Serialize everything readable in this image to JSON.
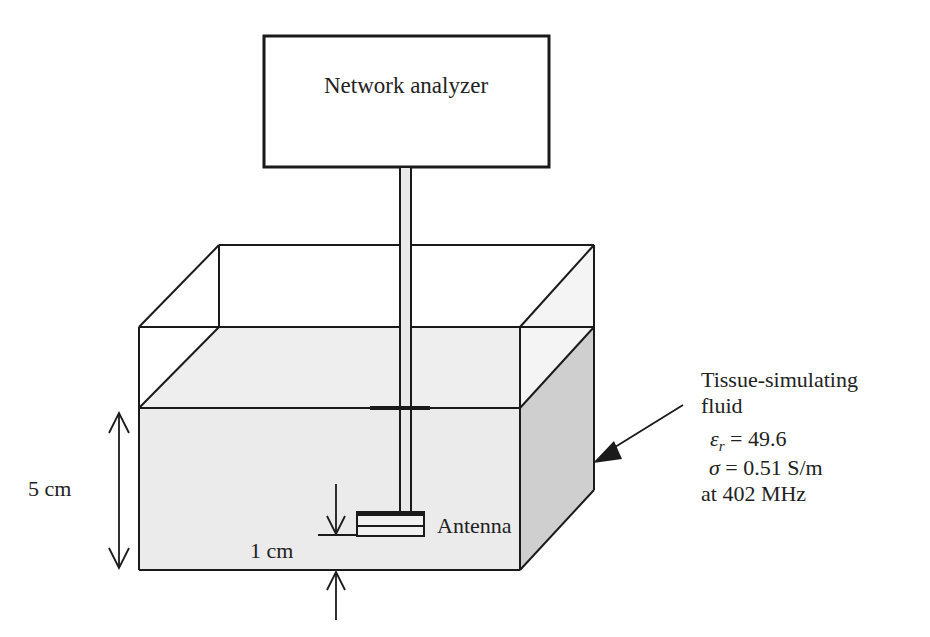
{
  "diagram": {
    "analyzer": {
      "label": "Network analyzer"
    },
    "antenna": {
      "label": "Antenna"
    },
    "fluid": {
      "title_line1": "Tissue-simulating",
      "title_line2": "fluid",
      "eps_symbol": "ε",
      "eps_sub": "r",
      "eps_value": " = 49.6",
      "sigma_symbol": "σ",
      "sigma_value": " = 0.51 S/m",
      "freq": "at 402 MHz"
    },
    "dimensions": {
      "depth": "5 cm",
      "antenna_height": "1 cm"
    },
    "colors": {
      "fluid_front": "#ebebeb",
      "fluid_top": "#eeeeee",
      "fluid_side": "#cfcfcf",
      "stroke": "#1a1a1a"
    }
  }
}
